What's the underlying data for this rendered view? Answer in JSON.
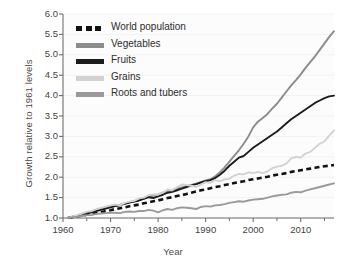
{
  "chart_data": {
    "type": "line",
    "title": "",
    "xlabel": "Year",
    "ylabel": "Growth relative to 1961 levels",
    "xlim": [
      1960,
      2017
    ],
    "ylim": [
      1.0,
      6.0
    ],
    "grid": true,
    "legend_position": "top-left",
    "xticks": [
      1960,
      1970,
      1980,
      1990,
      2000,
      2010
    ],
    "xticklabels": [
      "1960",
      "1970",
      "1980",
      "1990",
      "2000",
      "2010"
    ],
    "xminorticks": [
      1965,
      1975,
      1985,
      1995,
      2005,
      2015
    ],
    "yticks": [
      1.0,
      1.5,
      2.0,
      2.5,
      3.0,
      3.5,
      4.0,
      4.5,
      5.0,
      5.5,
      6.0
    ],
    "yticklabels": [
      "1.0",
      "1.5",
      "2.0",
      "2.5",
      "3.0",
      "3.5",
      "4.0",
      "4.5",
      "5.0",
      "5.5",
      "6.0"
    ],
    "x": [
      1961,
      1962,
      1963,
      1964,
      1965,
      1966,
      1967,
      1968,
      1969,
      1970,
      1971,
      1972,
      1973,
      1974,
      1975,
      1976,
      1977,
      1978,
      1979,
      1980,
      1981,
      1982,
      1983,
      1984,
      1985,
      1986,
      1987,
      1988,
      1989,
      1990,
      1991,
      1992,
      1993,
      1994,
      1995,
      1996,
      1997,
      1998,
      1999,
      2000,
      2001,
      2002,
      2003,
      2004,
      2005,
      2006,
      2007,
      2008,
      2009,
      2010,
      2011,
      2012,
      2013,
      2014,
      2015,
      2016,
      2017
    ],
    "series": [
      {
        "name": "World population",
        "style": "dashed",
        "color": "#111111",
        "values": [
          1.0,
          1.02,
          1.04,
          1.06,
          1.08,
          1.1,
          1.12,
          1.14,
          1.17,
          1.19,
          1.22,
          1.24,
          1.26,
          1.29,
          1.31,
          1.33,
          1.36,
          1.38,
          1.41,
          1.43,
          1.46,
          1.49,
          1.51,
          1.54,
          1.56,
          1.59,
          1.62,
          1.65,
          1.68,
          1.7,
          1.73,
          1.76,
          1.78,
          1.81,
          1.83,
          1.86,
          1.88,
          1.9,
          1.93,
          1.95,
          1.97,
          1.99,
          2.01,
          2.04,
          2.06,
          2.08,
          2.1,
          2.13,
          2.15,
          2.17,
          2.19,
          2.21,
          2.23,
          2.25,
          2.27,
          2.28,
          2.3
        ]
      },
      {
        "name": "Vegetables",
        "style": "solid",
        "color": "#8c8c8c",
        "values": [
          1.0,
          1.03,
          1.06,
          1.1,
          1.13,
          1.15,
          1.19,
          1.22,
          1.25,
          1.28,
          1.3,
          1.32,
          1.36,
          1.39,
          1.41,
          1.44,
          1.48,
          1.52,
          1.55,
          1.58,
          1.62,
          1.66,
          1.68,
          1.72,
          1.75,
          1.78,
          1.81,
          1.84,
          1.88,
          1.92,
          1.95,
          2.02,
          2.12,
          2.24,
          2.38,
          2.52,
          2.66,
          2.82,
          3.0,
          3.22,
          3.36,
          3.45,
          3.55,
          3.68,
          3.8,
          3.95,
          4.1,
          4.25,
          4.38,
          4.52,
          4.68,
          4.82,
          4.96,
          5.12,
          5.28,
          5.44,
          5.58
        ]
      },
      {
        "name": "Fruits",
        "style": "solid",
        "color": "#1c1c1c",
        "values": [
          1.0,
          1.03,
          1.05,
          1.08,
          1.11,
          1.14,
          1.17,
          1.2,
          1.23,
          1.26,
          1.29,
          1.31,
          1.35,
          1.38,
          1.4,
          1.43,
          1.47,
          1.51,
          1.49,
          1.53,
          1.57,
          1.62,
          1.64,
          1.68,
          1.72,
          1.76,
          1.8,
          1.83,
          1.87,
          1.9,
          1.93,
          1.98,
          2.06,
          2.16,
          2.28,
          2.38,
          2.48,
          2.52,
          2.62,
          2.72,
          2.8,
          2.88,
          2.96,
          3.04,
          3.12,
          3.22,
          3.32,
          3.42,
          3.5,
          3.58,
          3.66,
          3.74,
          3.82,
          3.88,
          3.94,
          3.98,
          4.0
        ]
      },
      {
        "name": "Grains",
        "style": "solid",
        "color": "#d2d2d2",
        "values": [
          1.0,
          1.04,
          1.07,
          1.11,
          1.15,
          1.17,
          1.22,
          1.25,
          1.28,
          1.31,
          1.33,
          1.31,
          1.37,
          1.4,
          1.42,
          1.48,
          1.5,
          1.56,
          1.58,
          1.57,
          1.62,
          1.7,
          1.68,
          1.76,
          1.82,
          1.81,
          1.79,
          1.76,
          1.82,
          1.88,
          1.86,
          1.93,
          1.9,
          1.95,
          1.96,
          2.04,
          2.08,
          2.07,
          2.12,
          2.1,
          2.13,
          2.1,
          2.14,
          2.22,
          2.26,
          2.28,
          2.34,
          2.46,
          2.5,
          2.48,
          2.58,
          2.62,
          2.72,
          2.82,
          2.88,
          3.02,
          3.15
        ]
      },
      {
        "name": "Roots and tubers",
        "style": "solid",
        "color": "#9a9a9a",
        "values": [
          1.0,
          1.02,
          1.03,
          1.05,
          1.07,
          1.07,
          1.1,
          1.11,
          1.12,
          1.13,
          1.13,
          1.12,
          1.15,
          1.16,
          1.15,
          1.17,
          1.17,
          1.2,
          1.18,
          1.14,
          1.19,
          1.22,
          1.2,
          1.24,
          1.26,
          1.25,
          1.24,
          1.22,
          1.27,
          1.29,
          1.28,
          1.31,
          1.32,
          1.34,
          1.37,
          1.39,
          1.41,
          1.4,
          1.43,
          1.45,
          1.46,
          1.47,
          1.5,
          1.53,
          1.55,
          1.57,
          1.58,
          1.62,
          1.64,
          1.63,
          1.67,
          1.7,
          1.73,
          1.76,
          1.79,
          1.82,
          1.85
        ]
      }
    ]
  },
  "legend": {
    "items": [
      {
        "label": "World population"
      },
      {
        "label": "Vegetables"
      },
      {
        "label": "Fruits"
      },
      {
        "label": "Grains"
      },
      {
        "label": "Roots and tubers"
      }
    ]
  }
}
